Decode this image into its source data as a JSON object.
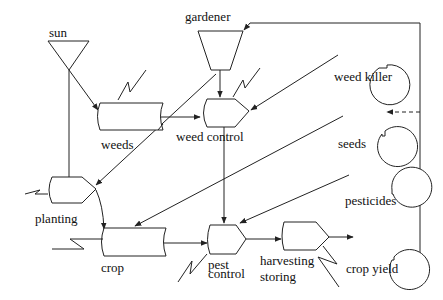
{
  "diagram": {
    "nodes": [
      {
        "id": "sun",
        "label": "sun",
        "type": "source-triangle"
      },
      {
        "id": "gardener",
        "label": "gardener",
        "type": "source-trapezoid"
      },
      {
        "id": "weeds",
        "label": "weeds",
        "type": "storage"
      },
      {
        "id": "weed_control",
        "label": "weed control",
        "type": "process"
      },
      {
        "id": "weed_killer",
        "label": "weed killer",
        "type": "input-circle"
      },
      {
        "id": "seeds",
        "label": "seeds",
        "type": "input-circle"
      },
      {
        "id": "planting",
        "label": "planting",
        "type": "process"
      },
      {
        "id": "pesticides",
        "label": "pesticides",
        "type": "input-circle"
      },
      {
        "id": "crop",
        "label": "crop",
        "type": "storage"
      },
      {
        "id": "pest_control",
        "label_line1": "pest",
        "label_line2": "control",
        "type": "process"
      },
      {
        "id": "harvesting_storing",
        "label_line1": "harvesting",
        "label_line2": "storing",
        "type": "process"
      },
      {
        "id": "crop_yield",
        "label": "crop yield",
        "type": "output-circle"
      }
    ],
    "edges": [
      {
        "from": "sun",
        "to": "weeds"
      },
      {
        "from": "sun",
        "to": "planting"
      },
      {
        "from": "gardener",
        "to": "weed_control"
      },
      {
        "from": "gardener",
        "to": "planting"
      },
      {
        "from": "weeds",
        "to": "weed_control"
      },
      {
        "from": "weed_killer",
        "to": "weed_control"
      },
      {
        "from": "seeds",
        "to": "crop"
      },
      {
        "from": "planting",
        "to": "crop"
      },
      {
        "from": "weed_control",
        "to": "pest_control"
      },
      {
        "from": "pesticides",
        "to": "pest_control"
      },
      {
        "from": "crop",
        "to": "pest_control"
      },
      {
        "from": "pest_control",
        "to": "harvesting_storing"
      },
      {
        "from": "harvesting_storing",
        "to": "crop_yield"
      },
      {
        "from": "crop_yield",
        "to": "gardener",
        "style": "feedback"
      },
      {
        "from": "crop_yield",
        "to": "seeds",
        "style": "dashed"
      }
    ]
  }
}
